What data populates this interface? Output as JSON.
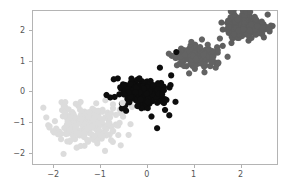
{
  "chart_data": {
    "type": "scatter",
    "title": "",
    "subtitle": "",
    "xlabel": "",
    "ylabel": "",
    "xlim": [
      -2.45,
      2.8
    ],
    "ylim": [
      -2.4,
      2.65
    ],
    "xticks": [
      -2,
      -1,
      0,
      1,
      2
    ],
    "yticks": [
      -2,
      -1,
      0,
      1,
      2
    ],
    "xticklabels": [
      "−2",
      "−1",
      "0",
      "1",
      "2"
    ],
    "yticklabels": [
      "−2",
      "−1",
      "0",
      "1",
      "2"
    ],
    "grid": false,
    "legend": false,
    "legend_position": "none",
    "frame": true,
    "marker": "circle",
    "marker_size": 3.1,
    "series": [
      {
        "name": "cluster-1",
        "color": "#dcdcdc",
        "n_points": 230,
        "center": [
          -1.3,
          -1.1
        ],
        "spread": [
          0.34,
          0.33
        ],
        "seed": 11
      },
      {
        "name": "cluster-2",
        "color": "#0d0d0d",
        "n_points": 230,
        "center": [
          -0.08,
          -0.07
        ],
        "spread": [
          0.24,
          0.21
        ],
        "seed": 27
      },
      {
        "name": "cluster-3",
        "color": "#636363",
        "n_points": 200,
        "center": [
          1.05,
          1.1
        ],
        "spread": [
          0.2,
          0.18
        ],
        "seed": 43
      },
      {
        "name": "cluster-4",
        "color": "#5e5e5e",
        "n_points": 215,
        "center": [
          2.1,
          2.12
        ],
        "spread": [
          0.23,
          0.18
        ],
        "seed": 59
      }
    ],
    "outliers": [
      {
        "x": 0.22,
        "y": -1.2,
        "color": "#0d0d0d"
      },
      {
        "x": 0.28,
        "y": 0.77,
        "color": "#0d0d0d"
      },
      {
        "x": 0.52,
        "y": 0.52,
        "color": "#0d0d0d"
      },
      {
        "x": 0.63,
        "y": 1.28,
        "color": "#0d0d0d"
      },
      {
        "x": -0.62,
        "y": 0.42,
        "color": "#0d0d0d"
      },
      {
        "x": -0.86,
        "y": -0.12,
        "color": "#0d0d0d"
      },
      {
        "x": -0.78,
        "y": -0.2,
        "color": "#0d0d0d"
      },
      {
        "x": 0.48,
        "y": -0.78,
        "color": "#0d0d0d"
      },
      {
        "x": 0.1,
        "y": -0.82,
        "color": "#0d0d0d"
      },
      {
        "x": 1.56,
        "y": 1.72,
        "color": "#636363"
      },
      {
        "x": 1.38,
        "y": 0.95,
        "color": "#636363"
      },
      {
        "x": 1.47,
        "y": 0.77,
        "color": "#636363"
      },
      {
        "x": 1.3,
        "y": 1.52,
        "color": "#636363"
      },
      {
        "x": 2.58,
        "y": 2.5,
        "color": "#5e5e5e"
      },
      {
        "x": 2.62,
        "y": 2.02,
        "color": "#5e5e5e"
      },
      {
        "x": 1.62,
        "y": 1.48,
        "color": "#5e5e5e"
      },
      {
        "x": -1.98,
        "y": -1.34,
        "color": "#dcdcdc"
      },
      {
        "x": -2.08,
        "y": -1.18,
        "color": "#dcdcdc"
      },
      {
        "x": -0.52,
        "y": -0.38,
        "color": "#dcdcdc"
      }
    ],
    "colors": {
      "background": "#ffffff",
      "frame": "#b4b4b4",
      "tick": "#b0b0b0",
      "tick_label": "#555555"
    }
  }
}
